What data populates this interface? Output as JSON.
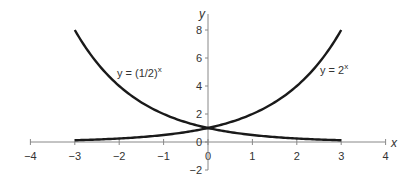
{
  "chart_data": {
    "type": "line",
    "title": "",
    "xlabel": "x",
    "ylabel": "y",
    "xlim": [
      -4,
      4
    ],
    "ylim": [
      -2,
      8.5
    ],
    "x_ticks": [
      -4,
      -3,
      -2,
      -1,
      0,
      1,
      2,
      3,
      4
    ],
    "x_tick_labels": [
      "−4",
      "−3",
      "−2",
      "−1",
      "0",
      "1",
      "2",
      "3",
      "4"
    ],
    "y_ticks": [
      -2,
      0,
      2,
      4,
      6,
      8
    ],
    "y_tick_labels": [
      "−2",
      "0",
      "2",
      "4",
      "6",
      "8"
    ],
    "grid": false,
    "legend": "none (inline curve annotations)",
    "x": [
      -3,
      -2.5,
      -2,
      -1.5,
      -1,
      -0.5,
      0,
      0.5,
      1,
      1.5,
      2,
      2.5,
      3
    ],
    "series": [
      {
        "name": "y = (1/2)^x",
        "label_main": "y = (1/2)",
        "label_sup": "x",
        "values": [
          8,
          5.66,
          4,
          2.83,
          2,
          1.41,
          1,
          0.71,
          0.5,
          0.35,
          0.25,
          0.18,
          0.125
        ]
      },
      {
        "name": "y = 2^x",
        "label_main": "y = 2",
        "label_sup": "x",
        "values": [
          0.125,
          0.18,
          0.25,
          0.35,
          0.5,
          0.71,
          1,
          1.41,
          2,
          2.83,
          4,
          5.66,
          8
        ]
      }
    ],
    "colors": {
      "curve": "#1a1a1a",
      "axis": "#888888",
      "text": "#333333"
    }
  }
}
